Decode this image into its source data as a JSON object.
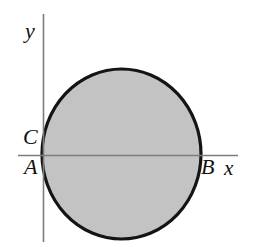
{
  "figure": {
    "type": "geometry-diagram",
    "background_color": "#ffffff",
    "axes": {
      "x_axis": {
        "label": "x",
        "color": "#7d7d7d",
        "start_x": 18,
        "end_x": 238,
        "y": 155
      },
      "y_axis": {
        "label": "y",
        "color": "#7d7d7d",
        "x": 43,
        "start_y": 14,
        "end_y": 242
      },
      "origin": {
        "x": 43,
        "y": 155
      }
    },
    "shape": {
      "kind": "circle",
      "fill_color": "#c3c3c3",
      "stroke_color": "#141414",
      "stroke_width": 3.2,
      "center_x": 121.5,
      "center_y": 154,
      "radius_x": 79.5,
      "radius_y": 85
    },
    "points": [
      {
        "name": "A",
        "label": "A",
        "x": 43,
        "y": 155,
        "description": "left intersection of circle with x-axis, on the y-axis"
      },
      {
        "name": "B",
        "label": "B",
        "x": 201,
        "y": 155,
        "description": "right intersection of circle with x-axis"
      },
      {
        "name": "C",
        "label": "C",
        "x": 43,
        "y": 137,
        "description": "point on y-axis above the origin"
      }
    ],
    "labels": {
      "y_axis_label": "y",
      "x_axis_label": "x",
      "point_a": "A",
      "point_b": "B",
      "point_c": "C"
    }
  }
}
